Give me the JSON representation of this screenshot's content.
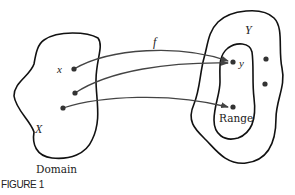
{
  "figure": {
    "caption": "FIGURE 1",
    "function_label": "f",
    "domain": {
      "set_label": "X",
      "element_label": "x",
      "name_label": "Domain"
    },
    "codomain": {
      "set_label": "Y",
      "element_label": "y",
      "range_label": "Range"
    },
    "colors": {
      "stroke": "#111111",
      "arrow": "#444444",
      "dot": "#333333",
      "text": "#222222",
      "background": "#ffffff"
    }
  }
}
